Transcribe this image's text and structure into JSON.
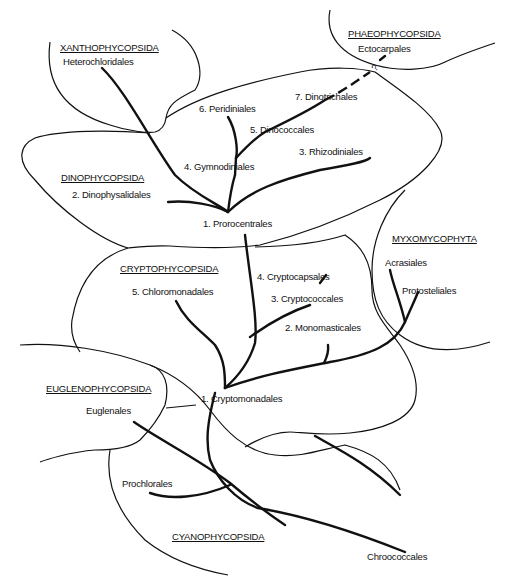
{
  "groups": {
    "xanthophycopsida": "XANTHOPHYCOPSIDA",
    "phaeophycopsida": "PHAEOPHYCOPSIDA",
    "dinophycopsida": "DINOPHYCOPSIDA",
    "cryptophycopsida": "CRYPTOPHYCOPSIDA",
    "myxomycophyta": "MYXOMYCOPHYTA",
    "euglenophycopsida": "EUGLENOPHYCOPSIDA",
    "cyanophycopsida": "CYANOPHYCOPSIDA"
  },
  "orders": {
    "heterochloridales": "Heterochloridales",
    "ectocarpales": "Ectocarpales",
    "uncertain_mark": "?",
    "peridiniales": "6. Peridiniales",
    "dinotrichales": "7. Dinotrichales",
    "dinococcales": "5. Dinococcales",
    "gymnodiniales": "4. Gymnodiniales",
    "rhizodiniales": "3. Rhizodiniales",
    "dinophysalidales": "2. Dinophysalidales",
    "prorocentrales": "1. Prorocentrales",
    "chloromonadales": "5. Chloromonadales",
    "cryptocapsales": "4. Cryptocapsales",
    "cryptococcales": "3. Cryptococcales",
    "monomasticales": "2. Monomasticales",
    "cryptomonadales": "1. Cryptomonadales",
    "acrasiales": "Acrasiales",
    "protosteliales": "Protosteliales",
    "euglenales": "Euglenales",
    "prochlorales": "Prochlorales",
    "chroococcales": "Chroococcales"
  }
}
